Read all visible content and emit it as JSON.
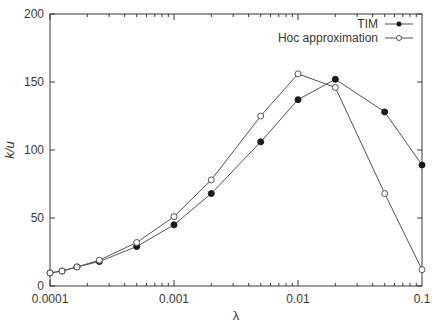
{
  "chart_data": {
    "type": "line",
    "title": "",
    "xlabel": "λ",
    "ylabel": "k/u",
    "xscale": "log",
    "xlim": [
      0.0001,
      0.1
    ],
    "ylim": [
      0,
      200
    ],
    "grid": false,
    "legend_position": "top-right",
    "x_ticks": [
      {
        "value": 0.0001,
        "label": "0.0001"
      },
      {
        "value": 0.001,
        "label": "0.001"
      },
      {
        "value": 0.01,
        "label": "0.01"
      },
      {
        "value": 0.1,
        "label": "0.1"
      }
    ],
    "y_ticks": [
      {
        "value": 0,
        "label": "0"
      },
      {
        "value": 50,
        "label": "50"
      },
      {
        "value": 100,
        "label": "100"
      },
      {
        "value": 150,
        "label": "150"
      },
      {
        "value": 200,
        "label": "200"
      }
    ],
    "x": [
      0.0001,
      0.000125,
      0.000165,
      0.00025,
      0.0005,
      0.001,
      0.002,
      0.005,
      0.01,
      0.02,
      0.05,
      0.1
    ],
    "series": [
      {
        "name": "TIM",
        "marker": "filled-circle",
        "color": "#1a1a1a",
        "values": [
          9.6,
          11,
          14,
          18,
          29,
          45,
          68,
          106,
          137,
          152,
          128,
          89
        ]
      },
      {
        "name": "Hoc approximation",
        "marker": "open-circle",
        "color": "#555555",
        "values": [
          9.6,
          11,
          14,
          19,
          32,
          51,
          78,
          125,
          156,
          146,
          68,
          12
        ]
      }
    ]
  },
  "legend": {
    "items": [
      {
        "label": "TIM",
        "marker": "filled-circle"
      },
      {
        "label": "Hoc approximation",
        "marker": "open-circle"
      }
    ]
  },
  "axes": {
    "x_label": "λ",
    "y_label": "k/u"
  },
  "colors": {
    "axis": "#3a3a3a",
    "line": "#555555",
    "filled_marker": "#1a1a1a",
    "background": "#ffffff"
  }
}
